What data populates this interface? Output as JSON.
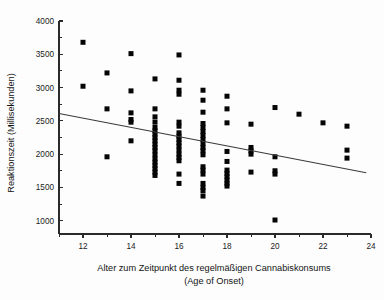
{
  "chart_data": {
    "type": "scatter",
    "title": "",
    "xlabel": "Alter zum Zeitpunkt des regelmäßigen Cannabiskonsums",
    "xlabel_line2": "(Age of Onset)",
    "ylabel": "Reaktionszeit (Millisekunden)",
    "xlim": [
      11,
      24
    ],
    "ylim": [
      800,
      4000
    ],
    "xticks": [
      12,
      14,
      16,
      18,
      20,
      22,
      24
    ],
    "xticklabels": [
      "12",
      "14",
      "16",
      "18",
      "20",
      "22",
      "24"
    ],
    "xminorticks": [
      11,
      13,
      15,
      17,
      19,
      21,
      23
    ],
    "yticks": [
      1000,
      1500,
      2000,
      2500,
      3000,
      3500,
      4000
    ],
    "yticklabels": [
      "1000",
      "1500",
      "2000",
      "2500",
      "3000",
      "3500",
      "4000"
    ],
    "grid": false,
    "legend": false,
    "marker": "square",
    "marker_color": "#050505",
    "marker_size": 5,
    "series": [
      {
        "name": "Probanden",
        "points": [
          [
            12,
            3680
          ],
          [
            12,
            3020
          ],
          [
            13,
            3220
          ],
          [
            13,
            2680
          ],
          [
            13,
            1960
          ],
          [
            14,
            3510
          ],
          [
            14,
            2950
          ],
          [
            14,
            2620
          ],
          [
            14,
            2520
          ],
          [
            14,
            2480
          ],
          [
            14,
            2200
          ],
          [
            15,
            3130
          ],
          [
            15,
            2680
          ],
          [
            15,
            2560
          ],
          [
            15,
            2480
          ],
          [
            15,
            2400
          ],
          [
            15,
            2350
          ],
          [
            15,
            2300
          ],
          [
            15,
            2250
          ],
          [
            15,
            2200
          ],
          [
            15,
            2150
          ],
          [
            15,
            2100
          ],
          [
            15,
            2050
          ],
          [
            15,
            1990
          ],
          [
            15,
            1930
          ],
          [
            15,
            1880
          ],
          [
            15,
            1830
          ],
          [
            15,
            1780
          ],
          [
            15,
            1730
          ],
          [
            15,
            1680
          ],
          [
            16,
            3490
          ],
          [
            16,
            3110
          ],
          [
            16,
            2960
          ],
          [
            16,
            2900
          ],
          [
            16,
            2480
          ],
          [
            16,
            2420
          ],
          [
            16,
            2320
          ],
          [
            16,
            2270
          ],
          [
            16,
            2220
          ],
          [
            16,
            2170
          ],
          [
            16,
            2120
          ],
          [
            16,
            2060
          ],
          [
            16,
            2000
          ],
          [
            16,
            1950
          ],
          [
            16,
            1900
          ],
          [
            16,
            1700
          ],
          [
            16,
            1560
          ],
          [
            17,
            2960
          ],
          [
            17,
            2810
          ],
          [
            17,
            2630
          ],
          [
            17,
            2460
          ],
          [
            17,
            2400
          ],
          [
            17,
            2340
          ],
          [
            17,
            2280
          ],
          [
            17,
            2220
          ],
          [
            17,
            2160
          ],
          [
            17,
            2100
          ],
          [
            17,
            2050
          ],
          [
            17,
            1990
          ],
          [
            17,
            1810
          ],
          [
            17,
            1760
          ],
          [
            17,
            1700
          ],
          [
            17,
            1560
          ],
          [
            17,
            1500
          ],
          [
            17,
            1450
          ],
          [
            17,
            1370
          ],
          [
            18,
            2870
          ],
          [
            18,
            2680
          ],
          [
            18,
            2470
          ],
          [
            18,
            2040
          ],
          [
            18,
            1890
          ],
          [
            18,
            1760
          ],
          [
            18,
            1710
          ],
          [
            18,
            1660
          ],
          [
            18,
            1610
          ],
          [
            18,
            1560
          ],
          [
            18,
            1520
          ],
          [
            19,
            2450
          ],
          [
            19,
            2100
          ],
          [
            19,
            2050
          ],
          [
            19,
            2000
          ],
          [
            19,
            1730
          ],
          [
            20,
            2700
          ],
          [
            20,
            1960
          ],
          [
            20,
            1750
          ],
          [
            20,
            1700
          ],
          [
            20,
            1010
          ],
          [
            21,
            2600
          ],
          [
            22,
            2470
          ],
          [
            23,
            2420
          ],
          [
            23,
            2060
          ],
          [
            23,
            1940
          ]
        ]
      }
    ],
    "trendline": {
      "name": "Regressionsgerade",
      "x_start": 11,
      "y_start": 2610,
      "x_end": 23.8,
      "y_end": 1720,
      "color": "#3a3a3a"
    }
  }
}
